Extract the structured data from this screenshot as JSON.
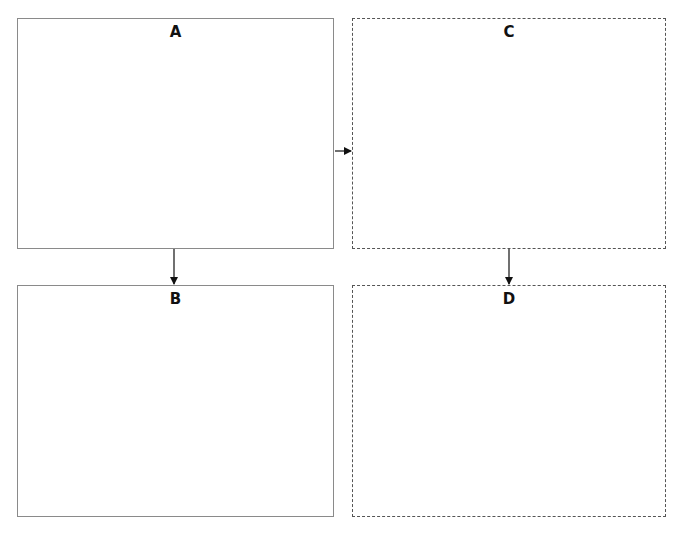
{
  "diagram": {
    "boxes": [
      {
        "id": "A",
        "label": "A",
        "style": "solid"
      },
      {
        "id": "B",
        "label": "B",
        "style": "solid"
      },
      {
        "id": "C",
        "label": "C",
        "style": "dashed"
      },
      {
        "id": "D",
        "label": "D",
        "style": "dashed"
      }
    ],
    "edges": [
      {
        "from": "A",
        "to": "B"
      },
      {
        "from": "A",
        "to": "C"
      },
      {
        "from": "C",
        "to": "D"
      }
    ]
  }
}
